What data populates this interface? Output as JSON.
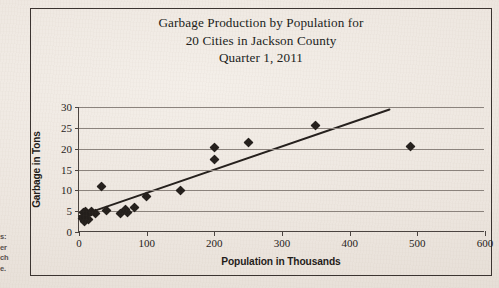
{
  "figure": {
    "title_lines": [
      "Garbage Production by Population for",
      "20 Cities in Jackson County",
      "Quarter 1, 2011"
    ],
    "margin_bleed_lines": [
      "s:",
      "er",
      "ch",
      "e."
    ]
  },
  "chart_data": {
    "type": "scatter",
    "xlabel": "Population in Thousands",
    "ylabel": "Garbage in Tons",
    "xlim": [
      0,
      600
    ],
    "ylim": [
      0,
      30
    ],
    "xticks": [
      0,
      100,
      200,
      300,
      400,
      500,
      600
    ],
    "yticks": [
      0,
      5,
      10,
      15,
      20,
      25,
      30
    ],
    "grid": "horizontal",
    "legend": "none",
    "marker": "diamond",
    "marker_color": "#241f1c",
    "series": [
      {
        "name": "Cities",
        "points": [
          [
            5,
            3.2
          ],
          [
            7,
            4.6
          ],
          [
            8,
            2.6
          ],
          [
            9,
            5.0
          ],
          [
            10,
            3.8
          ],
          [
            12,
            4.3
          ],
          [
            14,
            3.0
          ],
          [
            18,
            4.9
          ],
          [
            25,
            4.4
          ],
          [
            33,
            11.0
          ],
          [
            40,
            5.2
          ],
          [
            62,
            4.5
          ],
          [
            68,
            5.4
          ],
          [
            72,
            4.8
          ],
          [
            82,
            5.8
          ],
          [
            100,
            8.5
          ],
          [
            150,
            10.0
          ],
          [
            200,
            17.3
          ],
          [
            200,
            20.2
          ],
          [
            250,
            21.4
          ],
          [
            350,
            25.6
          ],
          [
            490,
            20.5
          ]
        ]
      }
    ],
    "trendline": {
      "type": "linear",
      "x_start": 0,
      "y_start": 3.6,
      "x_end": 460,
      "y_end": 29.4
    }
  }
}
